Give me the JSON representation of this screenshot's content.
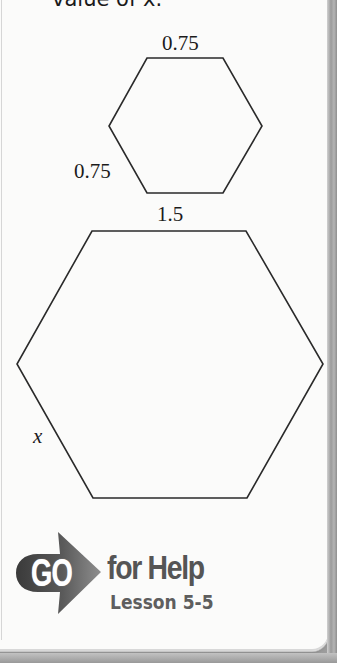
{
  "prompt": {
    "text": "value of x."
  },
  "figure": {
    "small_hexagon": {
      "top_label": "0.75",
      "side_label": "0.75",
      "vertices": [
        [
          147,
          58
        ],
        [
          223,
          58
        ],
        [
          262,
          126
        ],
        [
          223,
          193
        ],
        [
          147,
          193
        ],
        [
          109,
          126
        ]
      ]
    },
    "large_hexagon": {
      "top_label": "1.5",
      "side_label": "x",
      "vertices": [
        [
          92,
          231
        ],
        [
          246,
          231
        ],
        [
          323,
          364
        ],
        [
          247,
          498
        ],
        [
          93,
          498
        ],
        [
          17,
          364
        ]
      ]
    },
    "stroke_color": "#2a2a2a"
  },
  "help": {
    "go_label": "GO",
    "title": "for Help",
    "lesson": "Lesson 5-5",
    "arrow_color_dark": "#3e3e3e",
    "arrow_color_light": "#9a9a9a",
    "text_color": "#555555"
  }
}
